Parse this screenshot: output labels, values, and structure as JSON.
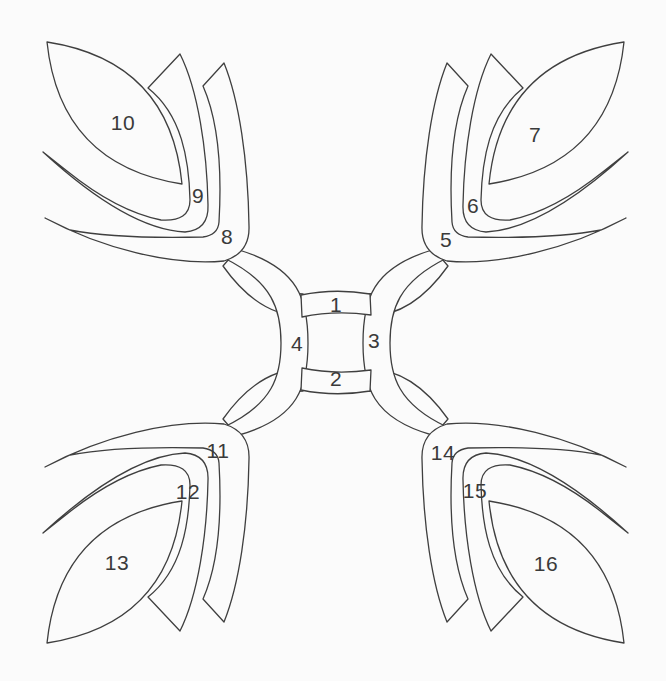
{
  "diagram": {
    "background_color": "#fbfbfb",
    "line_color": "#3f3f3f",
    "label_color": "#3a3a3a",
    "labels": [
      "1",
      "2",
      "3",
      "4",
      "5",
      "6",
      "7",
      "8",
      "9",
      "10",
      "11",
      "12",
      "13",
      "14",
      "15",
      "16"
    ]
  }
}
